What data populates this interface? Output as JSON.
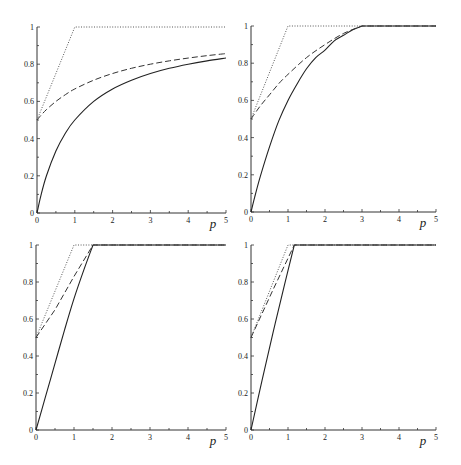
{
  "chart_data": [
    {
      "type": "line",
      "panel": "top-left",
      "title": "",
      "xlabel": "p",
      "ylabel": "",
      "xlim": [
        0,
        5
      ],
      "ylim": [
        0,
        1
      ],
      "xticks": [
        "0",
        "1",
        "2",
        "3",
        "4",
        "5"
      ],
      "yticks": [
        "0",
        "0.2",
        "0.4",
        "0.6",
        "0.8",
        "1"
      ],
      "grid": false,
      "legend": null,
      "series": [
        {
          "name": "solid",
          "style": "solid",
          "x": [
            0,
            0.1,
            0.25,
            0.5,
            0.75,
            1,
            1.5,
            2,
            2.5,
            3,
            3.5,
            4,
            4.5,
            5
          ],
          "y": [
            0,
            0.091,
            0.2,
            0.333,
            0.429,
            0.5,
            0.6,
            0.667,
            0.714,
            0.75,
            0.778,
            0.8,
            0.818,
            0.833
          ]
        },
        {
          "name": "dashed",
          "style": "dashed",
          "x": [
            0,
            0.1,
            0.25,
            0.5,
            0.75,
            1,
            1.5,
            2,
            2.5,
            3,
            3.5,
            4,
            4.5,
            5
          ],
          "y": [
            0.5,
            0.524,
            0.556,
            0.6,
            0.636,
            0.667,
            0.714,
            0.75,
            0.778,
            0.8,
            0.818,
            0.833,
            0.846,
            0.857
          ]
        },
        {
          "name": "dotted",
          "style": "dotted",
          "x": [
            0,
            1,
            5
          ],
          "y": [
            0.5,
            1,
            1
          ]
        }
      ]
    },
    {
      "type": "line",
      "panel": "top-right",
      "title": "",
      "xlabel": "p",
      "ylabel": "",
      "xlim": [
        0,
        5
      ],
      "ylim": [
        0,
        1
      ],
      "xticks": [
        "0",
        "1",
        "2",
        "3",
        "4",
        "5"
      ],
      "yticks": [
        "0",
        "0.2",
        "0.4",
        "0.6",
        "0.8",
        "1"
      ],
      "grid": false,
      "legend": null,
      "series": [
        {
          "name": "solid",
          "style": "solid",
          "x": [
            0,
            0.1,
            0.25,
            0.5,
            0.75,
            1,
            1.25,
            1.5,
            1.75,
            2,
            2.25,
            2.5,
            2.75,
            3,
            5
          ],
          "y": [
            0,
            0.08,
            0.19,
            0.35,
            0.49,
            0.6,
            0.69,
            0.77,
            0.83,
            0.87,
            0.92,
            0.95,
            0.98,
            1,
            1
          ]
        },
        {
          "name": "dashed",
          "style": "dashed",
          "x": [
            0,
            0.25,
            0.5,
            0.75,
            1,
            1.5,
            2,
            2.5,
            3,
            5
          ],
          "y": [
            0.5,
            0.57,
            0.63,
            0.69,
            0.74,
            0.83,
            0.9,
            0.96,
            1,
            1
          ]
        },
        {
          "name": "dotted",
          "style": "dotted",
          "x": [
            0,
            1,
            5
          ],
          "y": [
            0.5,
            1,
            1
          ]
        }
      ]
    },
    {
      "type": "line",
      "panel": "bottom-left",
      "title": "",
      "xlabel": "p",
      "ylabel": "",
      "xlim": [
        0,
        5
      ],
      "ylim": [
        0,
        1
      ],
      "xticks": [
        "0",
        "1",
        "2",
        "3",
        "4",
        "5"
      ],
      "yticks": [
        "0",
        "0.2",
        "0.4",
        "0.6",
        "0.8",
        "1"
      ],
      "grid": false,
      "legend": null,
      "series": [
        {
          "name": "solid",
          "style": "solid",
          "x": [
            0,
            0.25,
            0.5,
            0.75,
            1,
            1.25,
            1.5,
            5
          ],
          "y": [
            0,
            0.18,
            0.36,
            0.54,
            0.71,
            0.86,
            1,
            1
          ]
        },
        {
          "name": "dashed",
          "style": "dashed",
          "x": [
            0,
            0.5,
            1,
            1.5,
            5
          ],
          "y": [
            0.5,
            0.65,
            0.83,
            1,
            1
          ]
        },
        {
          "name": "dotted",
          "style": "dotted",
          "x": [
            0,
            1,
            5
          ],
          "y": [
            0.5,
            1,
            1
          ]
        }
      ]
    },
    {
      "type": "line",
      "panel": "bottom-right",
      "title": "",
      "xlabel": "p",
      "ylabel": "",
      "xlim": [
        0,
        5
      ],
      "ylim": [
        0,
        1
      ],
      "xticks": [
        "0",
        "1",
        "2",
        "3",
        "4",
        "5"
      ],
      "yticks": [
        "0",
        "0.2",
        "0.4",
        "0.6",
        "0.8",
        "1"
      ],
      "grid": false,
      "legend": null,
      "series": [
        {
          "name": "solid",
          "style": "solid",
          "x": [
            0,
            0.3,
            0.6,
            0.9,
            1.17,
            5
          ],
          "y": [
            0,
            0.27,
            0.53,
            0.78,
            1,
            1
          ]
        },
        {
          "name": "dashed",
          "style": "dashed",
          "x": [
            0,
            0.6,
            1.17,
            5
          ],
          "y": [
            0.5,
            0.76,
            1,
            1
          ]
        },
        {
          "name": "dotted",
          "style": "dotted",
          "x": [
            0,
            1,
            5
          ],
          "y": [
            0.5,
            1,
            1
          ]
        }
      ]
    }
  ],
  "layout": {
    "panels": [
      {
        "x0": 37,
        "x1": 226,
        "y0": 213,
        "y1": 27
      },
      {
        "x0": 251,
        "x1": 436,
        "y0": 212,
        "y1": 26
      },
      {
        "x0": 36,
        "x1": 226,
        "y0": 430,
        "y1": 245
      },
      {
        "x0": 251,
        "x1": 436,
        "y0": 430,
        "y1": 245
      }
    ]
  }
}
